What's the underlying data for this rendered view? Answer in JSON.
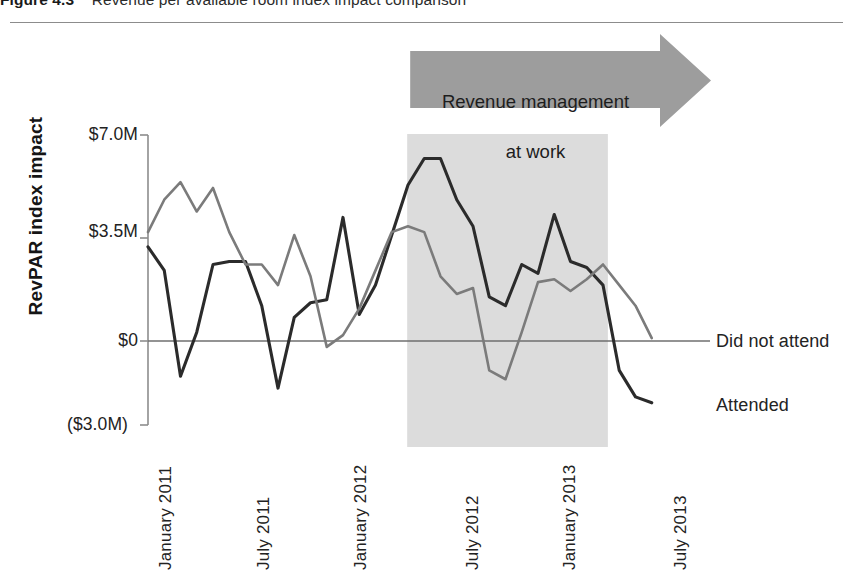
{
  "figure": {
    "number": "Figure 4.3",
    "caption": "Revenue per available room index impact comparison"
  },
  "colors": {
    "attended_line": "#2b2b2b",
    "did_not_attend_line": "#7b7b7b",
    "shaded_band": "#dcdcdc",
    "arrow_banner": "#9d9d9d",
    "axis": "#8d8d8d",
    "zero_line": "#6f6f6f",
    "rule": "#8c8c8c"
  },
  "annotation": {
    "banner_label": "Revenue management\nat work",
    "banner_line1": "Revenue management",
    "banner_line2": "at work",
    "band_start_label": "April 2012",
    "band_end_label": "March 2013"
  },
  "series_labels": {
    "did_not_attend": "Did not attend",
    "attended": "Attended"
  },
  "chart_data": {
    "type": "line",
    "title": "Revenue per available room index impact comparison",
    "xlabel": "",
    "ylabel": "RevPAR index impact",
    "ylim": [
      -3000000,
      7000000
    ],
    "ytick_values": [
      7000000,
      3500000,
      0,
      -3000000
    ],
    "ytick_labels": [
      "$7.0M",
      "$3.5M",
      "$0",
      "($3.0M)"
    ],
    "grid": false,
    "zero_line": true,
    "legend_position": "right-of-line-ends",
    "x_tick_labels": [
      "January 2011",
      "July 2011",
      "January 2012",
      "July 2012",
      "January 2013",
      "July 2013"
    ],
    "x_tick_indices": [
      0,
      6,
      12,
      18,
      24,
      30
    ],
    "x": [
      "January 2011",
      "February 2011",
      "March 2011",
      "April 2011",
      "May 2011",
      "June 2011",
      "July 2011",
      "August 2011",
      "September 2011",
      "October 2011",
      "November 2011",
      "December 2011",
      "January 2012",
      "February 2012",
      "March 2012",
      "April 2012",
      "May 2012",
      "June 2012",
      "July 2012",
      "August 2012",
      "September 2012",
      "October 2012",
      "November 2012",
      "December 2012",
      "January 2013",
      "February 2013",
      "March 2013",
      "April 2013",
      "May 2013",
      "June 2013",
      "July 2013",
      "August 2013"
    ],
    "series": [
      {
        "name": "Attended",
        "color": "#2b2b2b",
        "values": [
          3200000,
          2400000,
          -1200000,
          300000,
          2600000,
          2700000,
          2700000,
          1200000,
          -1600000,
          800000,
          1300000,
          1400000,
          4200000,
          900000,
          1900000,
          3600000,
          5300000,
          6200000,
          6200000,
          4800000,
          3900000,
          1500000,
          1200000,
          2600000,
          2300000,
          4300000,
          2700000,
          2500000,
          1900000,
          -1000000,
          -1900000,
          -2100000
        ]
      },
      {
        "name": "Did not attend",
        "color": "#7b7b7b",
        "values": [
          3700000,
          4800000,
          5400000,
          4400000,
          5200000,
          3700000,
          2600000,
          2600000,
          1900000,
          3600000,
          2200000,
          -200000,
          200000,
          1100000,
          2400000,
          3700000,
          3900000,
          3700000,
          2200000,
          1600000,
          1800000,
          -1000000,
          -1300000,
          300000,
          2000000,
          2100000,
          1700000,
          2100000,
          2600000,
          1900000,
          1200000,
          100000
        ]
      }
    ]
  }
}
